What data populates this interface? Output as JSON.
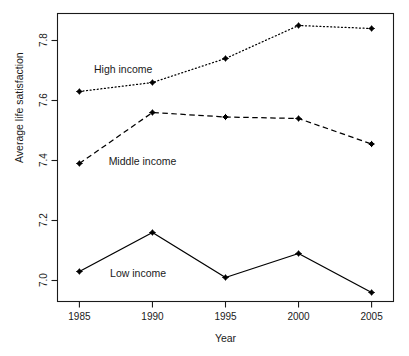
{
  "chart_data": {
    "type": "line",
    "title": "",
    "xlabel": "Year",
    "ylabel": "Average life satisfaction",
    "x": [
      1985,
      1990,
      1995,
      2000,
      2005
    ],
    "xtick_labels": [
      "1985",
      "1990",
      "1995",
      "2000",
      "2005"
    ],
    "ytick_labels": [
      "7.0",
      "7.2",
      "7.4",
      "7.6",
      "7.8"
    ],
    "ytick_values": [
      7.0,
      7.2,
      7.4,
      7.6,
      7.8
    ],
    "xlim": [
      1983.5,
      2006.5
    ],
    "ylim": [
      6.93,
      7.89
    ],
    "grid": false,
    "legend": "inline-annotations",
    "series": [
      {
        "name": "High income",
        "label": "High income",
        "linestyle": "dotted",
        "color": "#000000",
        "marker": "filled-diamond",
        "values": [
          7.63,
          7.66,
          7.74,
          7.85,
          7.84
        ],
        "label_x": 1986.0,
        "label_y": 7.705
      },
      {
        "name": "Middle income",
        "label": "Middle income",
        "linestyle": "dashed",
        "color": "#000000",
        "marker": "filled-diamond",
        "values": [
          7.39,
          7.56,
          7.545,
          7.54,
          7.455
        ],
        "label_x": 1987.0,
        "label_y": 7.4
      },
      {
        "name": "Low income",
        "label": "Low income",
        "linestyle": "solid",
        "color": "#000000",
        "marker": "filled-diamond",
        "values": [
          7.03,
          7.16,
          7.01,
          7.09,
          6.96
        ],
        "label_x": 1987.1,
        "label_y": 7.025
      }
    ]
  },
  "figure": {
    "axis_color": "#1a1a1a",
    "background": "#ffffff",
    "text_color": "#1a1a1a"
  }
}
